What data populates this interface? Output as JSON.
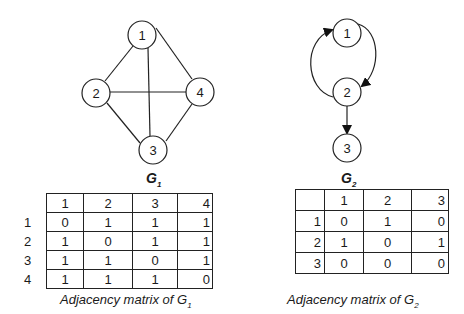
{
  "graph1": {
    "name": "G",
    "subscript": "1",
    "nodes": [
      {
        "id": "1",
        "x": 142,
        "y": 35
      },
      {
        "id": "2",
        "x": 96,
        "y": 93
      },
      {
        "id": "3",
        "x": 153,
        "y": 150
      },
      {
        "id": "4",
        "x": 200,
        "y": 92
      }
    ],
    "edges": [
      [
        "1",
        "2"
      ],
      [
        "1",
        "4"
      ],
      [
        "1",
        "3"
      ],
      [
        "2",
        "4"
      ],
      [
        "2",
        "3"
      ],
      [
        "3",
        "4"
      ]
    ],
    "directed": false
  },
  "graph2": {
    "name": "G",
    "subscript": "2",
    "nodes": [
      {
        "id": "1",
        "x": 347,
        "y": 33
      },
      {
        "id": "2",
        "x": 347,
        "y": 92
      },
      {
        "id": "3",
        "x": 347,
        "y": 148
      }
    ],
    "edges": [
      [
        "1",
        "2"
      ],
      [
        "2",
        "1"
      ],
      [
        "2",
        "3"
      ]
    ],
    "directed": true
  },
  "matrix1": {
    "headers": [
      "1",
      "2",
      "3",
      "4"
    ],
    "rows": [
      {
        "label": "1",
        "values": [
          "0",
          "1",
          "1",
          "1"
        ]
      },
      {
        "label": "2",
        "values": [
          "1",
          "0",
          "1",
          "1"
        ]
      },
      {
        "label": "3",
        "values": [
          "1",
          "1",
          "0",
          "1"
        ]
      },
      {
        "label": "4",
        "values": [
          "1",
          "1",
          "1",
          "0"
        ]
      }
    ],
    "caption": "Adjacency matrix of G",
    "caption_sub": "1"
  },
  "matrix2": {
    "headers": [
      "",
      "1",
      "2",
      "3"
    ],
    "rows": [
      {
        "label": "1",
        "values": [
          "0",
          "1",
          "0"
        ]
      },
      {
        "label": "2",
        "values": [
          "1",
          "0",
          "1"
        ]
      },
      {
        "label": "3",
        "values": [
          "0",
          "0",
          "0"
        ]
      }
    ],
    "caption": "Adjacency matrix of G",
    "caption_sub": "2"
  }
}
